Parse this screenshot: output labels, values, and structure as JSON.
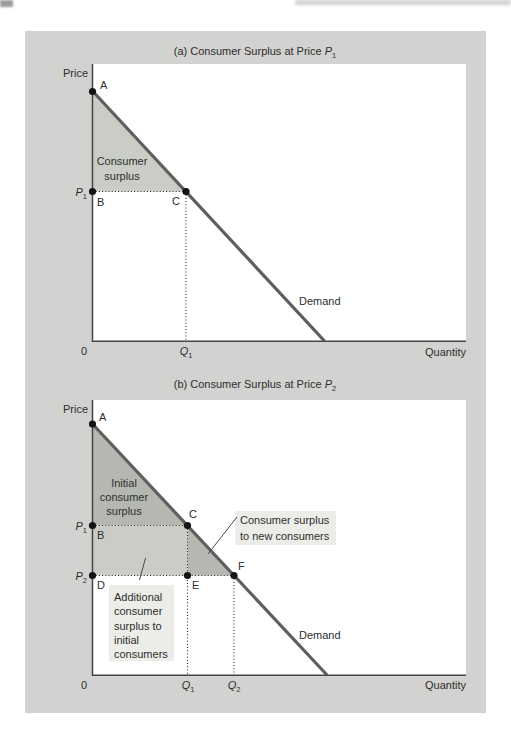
{
  "colors": {
    "figure_bg": "#d2d2d0",
    "plot_bg": "#ffffff",
    "shade_light": "#cacdc5",
    "shade_medium": "#b4b8b0",
    "demand_line": "#5e5e5e",
    "axis": "#444444",
    "dotted": "#2a2a2a",
    "callout": "#4a4a4a",
    "dot": "#141414",
    "label_box_bg": "#ecede8",
    "text": "#2e2e2e"
  },
  "panel_a": {
    "title": {
      "prefix": "(a) Consumer Surplus at Price ",
      "var": "P",
      "sub": "1"
    },
    "y_axis": "Price",
    "x_axis": "Quantity",
    "origin": "0",
    "demand": "Demand",
    "points": {
      "A": "A",
      "B": "B",
      "C": "C"
    },
    "p1": {
      "base": "P",
      "sub": "1"
    },
    "q1": {
      "base": "Q",
      "sub": "1"
    },
    "surplus_label": [
      "Consumer",
      "surplus"
    ]
  },
  "panel_b": {
    "title": {
      "prefix": "(b) Consumer Surplus at Price ",
      "var": "P",
      "sub": "2"
    },
    "y_axis": "Price",
    "x_axis": "Quantity",
    "origin": "0",
    "demand": "Demand",
    "points": {
      "A": "A",
      "B": "B",
      "C": "C",
      "D": "D",
      "E": "E",
      "F": "F"
    },
    "p1": {
      "base": "P",
      "sub": "1"
    },
    "p2": {
      "base": "P",
      "sub": "2"
    },
    "q1": {
      "base": "Q",
      "sub": "1"
    },
    "q2": {
      "base": "Q",
      "sub": "2"
    },
    "initial_surplus_label": [
      "Initial",
      "consumer",
      "surplus"
    ],
    "new_consumers_label": [
      "Consumer surplus",
      "to new consumers"
    ],
    "additional_label": [
      "Additional",
      "consumer",
      "surplus to",
      "initial",
      "consumers"
    ]
  }
}
